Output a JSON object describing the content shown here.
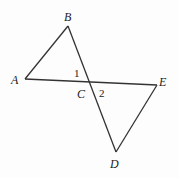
{
  "diagram": {
    "points": {
      "A": {
        "label": "A",
        "x": 25,
        "y": 79
      },
      "B": {
        "label": "B",
        "x": 68,
        "y": 26
      },
      "C": {
        "label": "C",
        "x": 89,
        "y": 81
      },
      "D": {
        "label": "D",
        "x": 116,
        "y": 152
      },
      "E": {
        "label": "E",
        "x": 157,
        "y": 85
      }
    },
    "angles": {
      "angle1": "1",
      "angle2": "2"
    },
    "segments": [
      "AB",
      "BD",
      "AE",
      "ED"
    ],
    "stroke_color": "#333333"
  }
}
